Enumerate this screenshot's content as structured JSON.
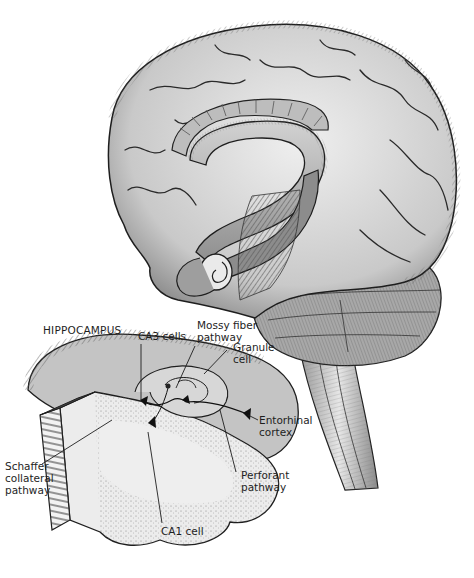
{
  "figure": {
    "palette": {
      "background": "#ffffff",
      "ink": "#1e1e1e",
      "cortex_fill": "#d9d9d9",
      "cortex_shade": "#8a8a8a",
      "hippocampus_fill": "#b8b8b8",
      "section_fill": "#e6e6e6",
      "stipple": "#9a9a9a"
    }
  },
  "labels": {
    "hippocampus_title": "HIPPOCAMPUS",
    "ca3_cells": "CA3 cells",
    "mossy_fiber": "Mossy fiber\npathway",
    "granule_cell": "Granule\ncell",
    "entorhinal_cortex": "Entorhinal\ncortex",
    "schaffer_collateral": "Schaffer\ncollateral\npathway",
    "perforant_pathway": "Perforant\npathway",
    "ca1_cell": "CA1 cell"
  }
}
